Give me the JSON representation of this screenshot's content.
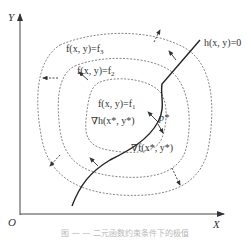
{
  "figure": {
    "axes": {
      "y_label": "Y",
      "x_label": "X",
      "origin_label": "O"
    },
    "contours": [
      {
        "id": "f1",
        "label_prefix": "f(x, y)=f",
        "subscript": "1"
      },
      {
        "id": "f2",
        "label_prefix": "f(x, y)=f",
        "subscript": "2"
      },
      {
        "id": "f3",
        "label_prefix": "f(x, y)=f",
        "subscript": "3"
      }
    ],
    "constraint": {
      "label": "h(x, y)=0"
    },
    "point": {
      "label": "p*"
    },
    "gradients": {
      "grad_h": "∇h(x*, y*)",
      "grad_f": "∇f(x*, y*)"
    },
    "caption": "图 — — 二元函数约束条件下的极值"
  },
  "colors": {
    "ink": "#222222",
    "contour": "#666666",
    "caption": "#b8b8b8"
  }
}
